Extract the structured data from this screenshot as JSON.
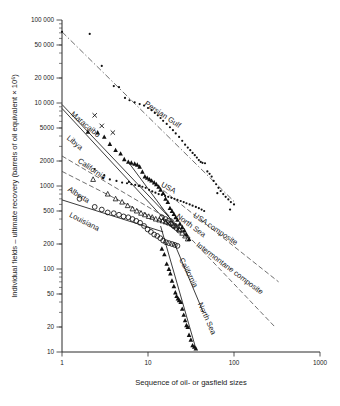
{
  "chart_data": {
    "type": "scatter",
    "title": "",
    "xlabel": "Sequence of oil- or gasfield sizes",
    "ylabel": "Individual fields – ultimate recovery (barrels of oil equivalent × 10⁶)",
    "xscale": "log",
    "yscale": "log",
    "xlim": [
      1,
      1000
    ],
    "ylim": [
      10,
      100000
    ],
    "grid": false,
    "legend": "none (curves labelled in-plot)",
    "xticks": [
      1,
      10,
      100,
      1000
    ],
    "xticklabels": [
      "1",
      "10",
      "100",
      "1000"
    ],
    "yticks": [
      10,
      20,
      50,
      100,
      200,
      500,
      1000,
      2000,
      5000,
      10000,
      20000,
      50000,
      100000
    ],
    "yticklabels": [
      "10",
      "20",
      "50",
      "100",
      "200",
      "500",
      "1000",
      "2000",
      "5000",
      "10 000",
      "20 000",
      "50 000",
      "100 000"
    ],
    "annotations": [
      {
        "text": "Persian Gulf",
        "x": 9,
        "y": 9500,
        "rotation": 34
      },
      {
        "text": "Maracaibo",
        "x": 1.25,
        "y": 7200,
        "rotation": 40
      },
      {
        "text": "Libya",
        "x": 1.12,
        "y": 3700,
        "rotation": 40
      },
      {
        "text": "California",
        "x": 1.5,
        "y": 1950,
        "rotation": 34
      },
      {
        "text": "Alberta",
        "x": 1.15,
        "y": 880,
        "rotation": 32
      },
      {
        "text": "Louisiana",
        "x": 1.2,
        "y": 430,
        "rotation": 27
      },
      {
        "text": "USA",
        "x": 14,
        "y": 1000,
        "rotation": 30
      },
      {
        "text": "North Sea",
        "x": 21,
        "y": 420,
        "rotation": 36
      },
      {
        "text": "USA composite",
        "x": 33,
        "y": 430,
        "rotation": 34
      },
      {
        "text": "Intermontane composite",
        "x": 36,
        "y": 190,
        "rotation": 37
      },
      {
        "text": "California",
        "x": 23,
        "y": 130,
        "rotation": 63
      },
      {
        "text": "North Sea",
        "x": 38,
        "y": 38,
        "rotation": 66
      }
    ],
    "series": [
      {
        "name": "Persian Gulf",
        "marker": "dot",
        "points": [
          [
            1.0,
            72000
          ],
          [
            2.1,
            68000
          ],
          [
            2.9,
            28000
          ],
          [
            4.0,
            16000
          ],
          [
            4.6,
            15500
          ],
          [
            5.4,
            11500
          ],
          [
            6.1,
            10800
          ],
          [
            7.0,
            10200
          ],
          [
            8.0,
            9700
          ],
          [
            9.0,
            9300
          ],
          [
            10.0,
            8700
          ],
          [
            11.0,
            8200
          ],
          [
            12.0,
            7600
          ],
          [
            13.0,
            7100
          ],
          [
            14.0,
            6600
          ],
          [
            15.0,
            6100
          ],
          [
            16.5,
            5600
          ],
          [
            18.0,
            5100
          ],
          [
            19.5,
            4700
          ],
          [
            21.0,
            4300
          ],
          [
            23.0,
            3900
          ],
          [
            25.0,
            3500
          ],
          [
            27.0,
            3150
          ],
          [
            29.0,
            2900
          ],
          [
            31.0,
            2700
          ],
          [
            33.0,
            2500
          ],
          [
            35.0,
            2350
          ],
          [
            37.0,
            2200
          ],
          [
            39.0,
            2050
          ],
          [
            41.0,
            1950
          ],
          [
            43.0,
            1900
          ],
          [
            46.0,
            1880
          ],
          [
            49.0,
            1500
          ],
          [
            52.0,
            1400
          ],
          [
            55.0,
            1300
          ],
          [
            58.0,
            1150
          ],
          [
            62.0,
            1050
          ],
          [
            66.0,
            950
          ],
          [
            70.0,
            870
          ],
          [
            75.0,
            800
          ],
          [
            80.0,
            740
          ],
          [
            86.0,
            690
          ],
          [
            92.0,
            640
          ],
          [
            100.0,
            600
          ],
          [
            64.0,
            820
          ],
          [
            90.0,
            520
          ]
        ]
      },
      {
        "name": "Maracaibo / Libya filled-triangle fields",
        "marker": "triangle",
        "points": [
          [
            2.0,
            4500
          ],
          [
            2.6,
            4400
          ],
          [
            3.1,
            3900
          ],
          [
            3.6,
            3200
          ],
          [
            4.2,
            2700
          ],
          [
            4.8,
            2450
          ],
          [
            5.3,
            2100
          ],
          [
            5.9,
            1950
          ],
          [
            6.4,
            1900
          ],
          [
            7.0,
            1850
          ],
          [
            7.5,
            1800
          ],
          [
            8.0,
            1700
          ],
          [
            8.6,
            1480
          ],
          [
            9.2,
            1300
          ],
          [
            9.8,
            1250
          ],
          [
            10.4,
            1200
          ],
          [
            11.0,
            1160
          ],
          [
            11.8,
            1100
          ],
          [
            12.5,
            1050
          ],
          [
            13.3,
            980
          ],
          [
            14.0,
            900
          ],
          [
            15.0,
            820
          ],
          [
            16.0,
            700
          ],
          [
            17.0,
            640
          ],
          [
            18.0,
            540
          ],
          [
            19.0,
            500
          ],
          [
            20.0,
            460
          ],
          [
            21.0,
            420
          ],
          [
            22.0,
            390
          ],
          [
            23.5,
            350
          ],
          [
            25.0,
            320
          ],
          [
            26.5,
            290
          ],
          [
            28.0,
            260
          ],
          [
            30.0,
            230
          ],
          [
            14.5,
            175
          ],
          [
            15.5,
            150
          ],
          [
            16.5,
            115
          ],
          [
            17.5,
            100
          ],
          [
            18.2,
            88
          ],
          [
            19.0,
            72
          ],
          [
            20.0,
            62
          ],
          [
            20.8,
            52
          ],
          [
            21.5,
            47
          ],
          [
            22.3,
            44
          ],
          [
            23.0,
            42
          ],
          [
            24.0,
            40
          ],
          [
            25.0,
            33
          ],
          [
            26.0,
            28
          ],
          [
            27.0,
            24
          ],
          [
            28.0,
            21
          ],
          [
            29.0,
            20
          ],
          [
            30.0,
            16
          ],
          [
            31.5,
            14
          ],
          [
            33.0,
            12
          ],
          [
            34.5,
            11.5
          ],
          [
            36.0,
            11
          ]
        ]
      },
      {
        "name": "x-marked fields",
        "marker": "x",
        "points": [
          [
            2.4,
            7100
          ],
          [
            2.9,
            5300
          ],
          [
            3.9,
            4400
          ]
        ]
      },
      {
        "name": "Louisiana",
        "marker": "open-circle",
        "points": [
          [
            1.6,
            700
          ],
          [
            2.4,
            560
          ],
          [
            2.9,
            520
          ],
          [
            3.4,
            480
          ],
          [
            4.0,
            470
          ],
          [
            4.6,
            450
          ],
          [
            5.2,
            430
          ],
          [
            5.9,
            420
          ],
          [
            6.6,
            400
          ],
          [
            7.3,
            380
          ],
          [
            8.1,
            360
          ],
          [
            9.0,
            330
          ],
          [
            9.9,
            300
          ],
          [
            10.8,
            280
          ],
          [
            11.8,
            260
          ],
          [
            12.8,
            250
          ],
          [
            13.9,
            235
          ],
          [
            15.0,
            220
          ],
          [
            16.2,
            210
          ],
          [
            17.5,
            205
          ],
          [
            19.0,
            200
          ],
          [
            20.5,
            195
          ],
          [
            22.0,
            190
          ],
          [
            14.5,
            420
          ],
          [
            16.0,
            400
          ],
          [
            17.2,
            380
          ],
          [
            18.5,
            350
          ],
          [
            20.0,
            330
          ],
          [
            21.5,
            310
          ],
          [
            23.0,
            290
          ]
        ]
      },
      {
        "name": "Alberta",
        "marker": "open-triangle",
        "points": [
          [
            2.3,
            1200
          ],
          [
            3.4,
            800
          ],
          [
            4.2,
            700
          ],
          [
            5.0,
            640
          ],
          [
            5.8,
            580
          ],
          [
            6.6,
            530
          ],
          [
            7.4,
            500
          ],
          [
            8.3,
            470
          ],
          [
            9.2,
            450
          ],
          [
            10.2,
            430
          ],
          [
            11.2,
            420
          ],
          [
            12.3,
            400
          ],
          [
            13.5,
            390
          ],
          [
            14.8,
            380
          ],
          [
            16.0,
            370
          ],
          [
            17.5,
            360
          ],
          [
            19.0,
            350
          ],
          [
            21.0,
            330
          ],
          [
            23.0,
            300
          ],
          [
            25.0,
            270
          ],
          [
            27.0,
            250
          ],
          [
            29.0,
            230
          ]
        ]
      },
      {
        "name": "USA small-dot fields",
        "marker": "dot",
        "points": [
          [
            2.4,
            1600
          ],
          [
            3.1,
            1350
          ],
          [
            4.3,
            1150
          ],
          [
            5.0,
            1100
          ],
          [
            5.7,
            1080
          ],
          [
            6.4,
            1050
          ],
          [
            7.1,
            1030
          ],
          [
            7.8,
            1000
          ],
          [
            8.6,
            980
          ],
          [
            9.4,
            950
          ],
          [
            10.3,
            900
          ],
          [
            11.2,
            860
          ],
          [
            12.2,
            830
          ],
          [
            13.3,
            800
          ],
          [
            14.5,
            780
          ],
          [
            15.8,
            760
          ],
          [
            17.2,
            740
          ],
          [
            18.7,
            720
          ],
          [
            20.3,
            700
          ],
          [
            22.0,
            680
          ],
          [
            24.0,
            660
          ],
          [
            26.0,
            640
          ],
          [
            28.0,
            620
          ],
          [
            30.5,
            600
          ],
          [
            33.0,
            580
          ],
          [
            36.0,
            560
          ],
          [
            39.0,
            540
          ],
          [
            42.0,
            520
          ],
          [
            45.0,
            500
          ],
          [
            3.0,
            1250
          ],
          [
            3.6,
            1200
          ],
          [
            6.0,
            1120
          ],
          [
            8.0,
            1010
          ]
        ]
      }
    ],
    "trendlines": [
      {
        "name": "Persian Gulf trend",
        "style": "dashdot",
        "from": [
          1,
          72000
        ],
        "to": [
          105,
          620
        ]
      },
      {
        "name": "Maracaibo",
        "style": "solid",
        "from": [
          1,
          9600
        ],
        "to": [
          22,
          330
        ]
      },
      {
        "name": "Libya",
        "style": "solid",
        "from": [
          1,
          8600
        ],
        "to": [
          20,
          300
        ]
      },
      {
        "name": "California upper",
        "style": "dash",
        "from": [
          1,
          2300
        ],
        "to": [
          16,
          420
        ]
      },
      {
        "name": "Alberta",
        "style": "dash",
        "from": [
          1,
          1500
        ],
        "to": [
          30,
          250
        ]
      },
      {
        "name": "Louisiana",
        "style": "solid",
        "from": [
          1,
          680
        ],
        "to": [
          15,
          280
        ]
      },
      {
        "name": "USA composite",
        "style": "dash",
        "from": [
          11,
          1150
        ],
        "to": [
          330,
          70
        ]
      },
      {
        "name": "Intermontane composite",
        "style": "dash",
        "from": [
          14,
          560
        ],
        "to": [
          300,
          20
        ]
      },
      {
        "name": "California steep",
        "style": "solid",
        "from": [
          14,
          330
        ],
        "to": [
          36,
          11
        ]
      },
      {
        "name": "North Sea steep",
        "style": "solid",
        "from": [
          20,
          210
        ],
        "to": [
          44,
          30
        ]
      },
      {
        "name": "USA cluster",
        "style": "solid",
        "from": [
          6,
          1900
        ],
        "to": [
          23,
          290
        ]
      }
    ]
  }
}
